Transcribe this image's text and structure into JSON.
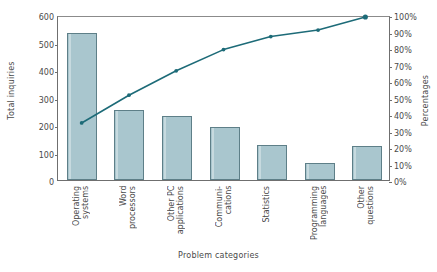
{
  "chart_data": {
    "type": "bar",
    "title": "",
    "xlabel": "Problem categories",
    "ylabel": "Total inquiries",
    "ylabel_secondary": "Percentages",
    "categories": [
      "Operating\nsystems",
      "Word\nprocessors",
      "Other PC\napplications",
      "Communi-\ncations",
      "Statistics",
      "Programming\nlanguages",
      "Other\nquestions"
    ],
    "values": [
      535,
      255,
      233,
      193,
      128,
      62,
      122
    ],
    "ylim": [
      0,
      600
    ],
    "yticks": [
      0,
      100,
      200,
      300,
      400,
      500,
      600
    ],
    "ytick_labels": [
      "0",
      "100",
      "200",
      "300",
      "400",
      "500",
      "600"
    ],
    "ylim_secondary": [
      0,
      100
    ],
    "yticks_secondary": [
      0,
      10,
      20,
      30,
      40,
      50,
      60,
      70,
      80,
      90,
      100
    ],
    "ytick_labels_secondary": [
      "0%",
      "10%",
      "20%",
      "30%",
      "40%",
      "50%",
      "60%",
      "70%",
      "80%",
      "90%",
      "100%"
    ],
    "series": [
      {
        "name": "Cumulative percentage",
        "type": "line",
        "values": [
          35,
          52,
          67,
          80,
          88,
          92,
          100
        ]
      }
    ],
    "total": 1528,
    "grid": false,
    "legend": "none",
    "colors": {
      "bar_fill": "#a9c6ce",
      "bar_edge": "#5e7f88",
      "line": "#1d6b78",
      "axis": "#6f6f6f",
      "text": "#4a4a4a"
    }
  }
}
